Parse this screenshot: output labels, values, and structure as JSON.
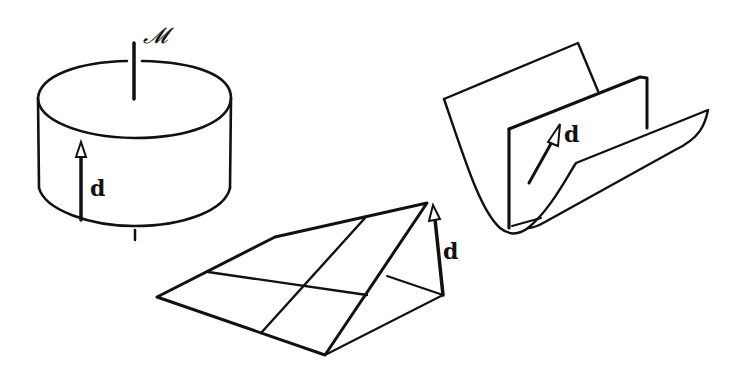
{
  "figure": {
    "labels": {
      "manifold": "𝓜",
      "cylinder_vector": "d",
      "wedge_vector": "d",
      "trough_vector": "d"
    },
    "colors": {
      "ink": "#111111",
      "background": "#ffffff"
    }
  }
}
